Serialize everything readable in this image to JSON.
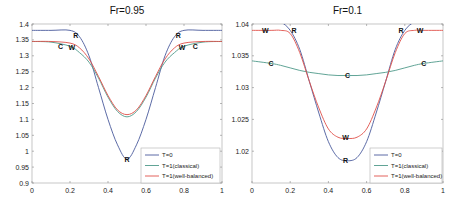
{
  "chart_data": [
    {
      "type": "line",
      "title": "Fr=0.95",
      "xlabel": "",
      "ylabel": "",
      "xlim": [
        0,
        1
      ],
      "ylim": [
        0.9,
        1.4
      ],
      "xticks": [
        "0",
        "0.2",
        "0.4",
        "0.6",
        "0.8",
        "1"
      ],
      "yticks": [
        "0.9",
        "0.95",
        "1",
        "1.05",
        "1.1",
        "1.15",
        "1.2",
        "1.25",
        "1.3",
        "1.35",
        "1.4"
      ],
      "grid": false,
      "legend_position": "lower right",
      "x": [
        0,
        0.1,
        0.2,
        0.25,
        0.3,
        0.35,
        0.4,
        0.45,
        0.5,
        0.55,
        0.6,
        0.65,
        0.7,
        0.75,
        0.8,
        0.9,
        1
      ],
      "series": [
        {
          "name": "T=0",
          "color": "#4a5a9c",
          "values": [
            1.38,
            1.38,
            1.38,
            1.36,
            1.3,
            1.2,
            1.1,
            1.02,
            0.975,
            1.02,
            1.1,
            1.2,
            1.3,
            1.36,
            1.38,
            1.38,
            1.38
          ]
        },
        {
          "name": "T=1(classical)",
          "color": "#4f9a8a",
          "values": [
            1.345,
            1.343,
            1.33,
            1.31,
            1.28,
            1.23,
            1.17,
            1.125,
            1.108,
            1.125,
            1.17,
            1.23,
            1.28,
            1.31,
            1.33,
            1.343,
            1.345
          ]
        },
        {
          "name": "T=1(well-balanced)",
          "color": "#e0504a",
          "values": [
            1.345,
            1.345,
            1.34,
            1.325,
            1.29,
            1.235,
            1.175,
            1.13,
            1.115,
            1.13,
            1.175,
            1.235,
            1.29,
            1.325,
            1.34,
            1.345,
            1.345
          ]
        }
      ],
      "annotations": [
        {
          "text": "R",
          "x": 0.23,
          "y": 1.365
        },
        {
          "text": "C",
          "x": 0.15,
          "y": 1.33
        },
        {
          "text": "W",
          "x": 0.21,
          "y": 1.325
        },
        {
          "text": "R",
          "x": 0.77,
          "y": 1.365
        },
        {
          "text": "W",
          "x": 0.79,
          "y": 1.325
        },
        {
          "text": "C",
          "x": 0.86,
          "y": 1.33
        },
        {
          "text": "R",
          "x": 0.5,
          "y": 0.975
        }
      ]
    },
    {
      "type": "line",
      "title": "Fr=0.1",
      "xlabel": "",
      "ylabel": "",
      "xlim": [
        0,
        1
      ],
      "ylim": [
        1.015,
        1.04
      ],
      "xticks": [
        "0",
        "0.2",
        "0.4",
        "0.6",
        "0.8",
        "1"
      ],
      "yticks": [
        "1.02",
        "1.025",
        "1.03",
        "1.035",
        "1.04"
      ],
      "grid": false,
      "legend_position": "lower right",
      "x": [
        0,
        0.1,
        0.15,
        0.2,
        0.25,
        0.3,
        0.35,
        0.4,
        0.45,
        0.5,
        0.55,
        0.6,
        0.65,
        0.7,
        0.75,
        0.8,
        0.85,
        0.9,
        1
      ],
      "series": [
        {
          "name": "T=0",
          "color": "#4a5a9c",
          "values": [
            1.0405,
            1.0405,
            1.0403,
            1.039,
            1.036,
            1.031,
            1.026,
            1.0215,
            1.019,
            1.0185,
            1.019,
            1.0215,
            1.026,
            1.031,
            1.036,
            1.039,
            1.0403,
            1.0405,
            1.0405
          ]
        },
        {
          "name": "T=1(classical)",
          "color": "#4f9a8a",
          "values": [
            1.0342,
            1.0338,
            1.0335,
            1.0331,
            1.0327,
            1.0324,
            1.0322,
            1.032,
            1.0319,
            1.0319,
            1.0319,
            1.032,
            1.0322,
            1.0324,
            1.0327,
            1.0331,
            1.0335,
            1.0338,
            1.0342
          ]
        },
        {
          "name": "T=1(well-balanced)",
          "color": "#e0504a",
          "values": [
            1.039,
            1.039,
            1.039,
            1.0385,
            1.0355,
            1.031,
            1.0268,
            1.0235,
            1.0222,
            1.022,
            1.0222,
            1.0235,
            1.0268,
            1.031,
            1.0355,
            1.0385,
            1.039,
            1.039,
            1.039
          ]
        }
      ],
      "annotations": [
        {
          "text": "W",
          "x": 0.07,
          "y": 1.039
        },
        {
          "text": "R",
          "x": 0.22,
          "y": 1.039
        },
        {
          "text": "C",
          "x": 0.1,
          "y": 1.0338
        },
        {
          "text": "C",
          "x": 0.5,
          "y": 1.0319
        },
        {
          "text": "R",
          "x": 0.78,
          "y": 1.039
        },
        {
          "text": "W",
          "x": 0.88,
          "y": 1.039
        },
        {
          "text": "C",
          "x": 0.9,
          "y": 1.0338
        },
        {
          "text": "W",
          "x": 0.49,
          "y": 1.0222
        },
        {
          "text": "R",
          "x": 0.49,
          "y": 1.0185
        }
      ]
    }
  ]
}
